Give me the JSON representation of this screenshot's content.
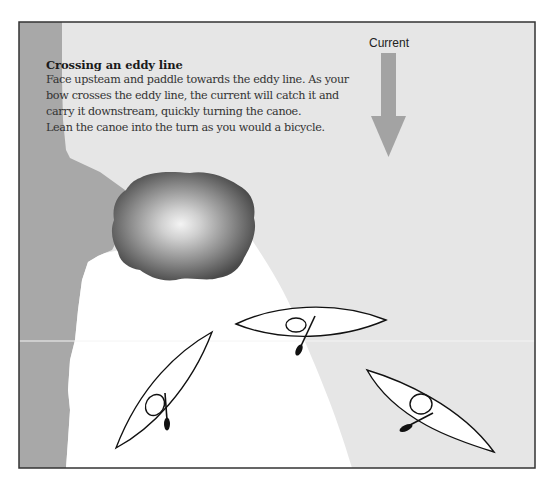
{
  "diagram": {
    "title": "Crossing an eddy line",
    "body_lines": [
      "Face upsteam and paddle towards the eddy line. As your",
      "bow crosses the eddy line, the current will catch it and",
      "carry it downstream, quickly turning the canoe.",
      "Lean the canoe into the turn as you would a bicycle."
    ],
    "current_label": "Current",
    "icons": {
      "current_arrow": "down-arrow-icon",
      "rock": "rock-shape",
      "canoes": [
        "canoe-icon",
        "canoe-icon",
        "canoe-icon"
      ]
    },
    "colors": {
      "main_current": "#e6e6e6",
      "eddy": "#ffffff",
      "bank": "#a8a8a8",
      "arrow": "#a3a3a3",
      "rock_dark": "#4a4a4a",
      "rock_light": "#f2f2f2",
      "frame": "#333333",
      "outline": "#111111"
    }
  }
}
